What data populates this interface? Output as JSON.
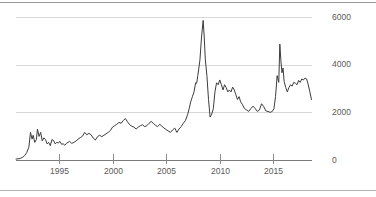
{
  "chart_data": {
    "type": "line",
    "title": "",
    "subtitle": "",
    "xlabel": "",
    "ylabel": "",
    "xlim": [
      1991.0,
      2018.6
    ],
    "ylim": [
      0,
      6400
    ],
    "grid": true,
    "legend": null,
    "y_ticks": [
      0,
      2000,
      4000,
      6000
    ],
    "y_tick_labels": [
      "0",
      "2000",
      "4000",
      "6000"
    ],
    "x_ticks": [
      1995,
      2000,
      2005,
      2010,
      2015
    ],
    "x_tick_labels": [
      "1995",
      "2000",
      "2005",
      "2010",
      "2015"
    ],
    "line_color": "#3c3c3c",
    "grid_color": "#d8d8d8",
    "axis_color": "#7a7a7a",
    "series": [
      {
        "name": "index",
        "x": [
          1991.0,
          1991.2,
          1991.4,
          1991.6,
          1991.8,
          1992.0,
          1992.2,
          1992.35,
          1992.5,
          1992.6,
          1992.75,
          1992.9,
          1993.0,
          1993.15,
          1993.3,
          1993.45,
          1993.6,
          1993.75,
          1993.9,
          1994.05,
          1994.2,
          1994.35,
          1994.5,
          1994.65,
          1994.8,
          1994.95,
          1995.1,
          1995.25,
          1995.4,
          1995.55,
          1995.7,
          1995.85,
          1996.0,
          1996.2,
          1996.4,
          1996.6,
          1996.8,
          1997.0,
          1997.2,
          1997.4,
          1997.6,
          1997.8,
          1998.0,
          1998.2,
          1998.4,
          1998.6,
          1998.8,
          1999.0,
          1999.2,
          1999.4,
          1999.6,
          1999.8,
          2000.0,
          2000.2,
          2000.4,
          2000.6,
          2000.8,
          2001.0,
          2001.2,
          2001.4,
          2001.6,
          2001.8,
          2002.0,
          2002.2,
          2002.4,
          2002.6,
          2002.8,
          2003.0,
          2003.2,
          2003.4,
          2003.6,
          2003.8,
          2004.0,
          2004.2,
          2004.4,
          2004.6,
          2004.8,
          2005.0,
          2005.2,
          2005.4,
          2005.6,
          2005.8,
          2006.0,
          2006.2,
          2006.4,
          2006.6,
          2006.8,
          2007.0,
          2007.15,
          2007.3,
          2007.45,
          2007.6,
          2007.75,
          2007.85,
          2007.95,
          2008.05,
          2008.15,
          2008.3,
          2008.45,
          2008.55,
          2008.65,
          2008.8,
          2008.95,
          2009.1,
          2009.25,
          2009.4,
          2009.55,
          2009.7,
          2009.85,
          2010.0,
          2010.15,
          2010.3,
          2010.45,
          2010.6,
          2010.75,
          2010.9,
          2011.05,
          2011.2,
          2011.35,
          2011.5,
          2011.65,
          2011.8,
          2011.95,
          2012.1,
          2012.3,
          2012.5,
          2012.7,
          2012.9,
          2013.1,
          2013.3,
          2013.5,
          2013.7,
          2013.9,
          2014.1,
          2014.3,
          2014.5,
          2014.7,
          2014.9,
          2015.05,
          2015.2,
          2015.35,
          2015.5,
          2015.6,
          2015.7,
          2015.8,
          2015.9,
          2016.0,
          2016.15,
          2016.3,
          2016.45,
          2016.6,
          2016.75,
          2016.9,
          2017.05,
          2017.2,
          2017.35,
          2017.5,
          2017.65,
          2017.8,
          2017.95,
          2018.1,
          2018.25,
          2018.4,
          2018.55
        ],
        "values": [
          60,
          70,
          90,
          130,
          200,
          330,
          560,
          1180,
          900,
          1060,
          760,
          880,
          1320,
          1010,
          1180,
          820,
          950,
          880,
          700,
          760,
          620,
          880,
          840,
          700,
          760,
          740,
          800,
          680,
          700,
          640,
          720,
          760,
          800,
          720,
          760,
          820,
          900,
          960,
          1020,
          1180,
          1080,
          1140,
          1080,
          940,
          860,
          1000,
          1060,
          1000,
          1060,
          1120,
          1180,
          1260,
          1400,
          1460,
          1520,
          1600,
          1560,
          1680,
          1760,
          1620,
          1500,
          1440,
          1400,
          1320,
          1400,
          1460,
          1500,
          1420,
          1460,
          1560,
          1640,
          1560,
          1480,
          1420,
          1520,
          1440,
          1360,
          1300,
          1240,
          1180,
          1280,
          1360,
          1180,
          1320,
          1420,
          1560,
          1680,
          1920,
          2180,
          2480,
          2680,
          2880,
          3260,
          3240,
          3560,
          3880,
          4220,
          5180,
          5880,
          5180,
          4260,
          3560,
          2560,
          1820,
          1940,
          2180,
          2880,
          3260,
          3180,
          3380,
          3180,
          2960,
          3180,
          3060,
          2880,
          2960,
          2880,
          3080,
          2960,
          2760,
          2560,
          2680,
          2460,
          2360,
          2180,
          2120,
          2060,
          2180,
          2280,
          2180,
          2060,
          2120,
          2380,
          2260,
          2080,
          2060,
          2020,
          2060,
          2180,
          2680,
          3560,
          3280,
          4880,
          4180,
          3680,
          3880,
          3320,
          3060,
          2880,
          3060,
          3180,
          3120,
          3280,
          3240,
          3180,
          3360,
          3280,
          3420,
          3380,
          3460,
          3420,
          3180,
          2880,
          2560
        ]
      }
    ]
  },
  "axes": {
    "y_axis_name": "value-axis",
    "x_axis_name": "year-axis"
  }
}
